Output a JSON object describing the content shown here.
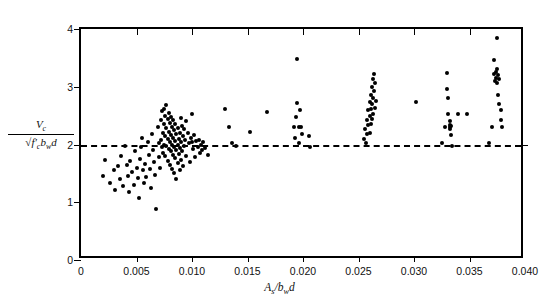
{
  "chart_data": {
    "type": "scatter",
    "title": "",
    "xlabel": "As/bwd",
    "ylabel": "Vc/sqrt(f'c)bwd",
    "xlim": [
      0,
      0.04
    ],
    "ylim": [
      0,
      4
    ],
    "xticks": [
      0,
      0.005,
      0.01,
      0.015,
      0.02,
      0.025,
      0.03,
      0.035,
      0.04
    ],
    "xticklabels": [
      "0",
      "0.005",
      "0.010",
      "0.015",
      "0.020",
      "0.025",
      "0.030",
      "0.035",
      "0.040"
    ],
    "yticks": [
      0,
      1,
      2,
      3,
      4
    ],
    "yticklabels": [
      "0",
      "1",
      "2",
      "3",
      "4"
    ],
    "grid": false,
    "legend": null,
    "marker": "filled-circle",
    "marker_color": "#000000",
    "reference_line": {
      "type": "horizontal-dashed",
      "y": 2.0,
      "label": "Vc = 2*sqrt(f'c)bwd",
      "style": "dashed",
      "color": "#000000"
    },
    "annotation": {
      "text": "Vc  = 2√f'cbwd",
      "points_to_x": 0.0195,
      "points_to_y": 2.0
    },
    "points": [
      [
        0.002,
        1.46
      ],
      [
        0.0022,
        1.73
      ],
      [
        0.0026,
        1.34
      ],
      [
        0.003,
        1.55
      ],
      [
        0.0031,
        1.21
      ],
      [
        0.0033,
        1.62
      ],
      [
        0.0035,
        1.4
      ],
      [
        0.0036,
        1.8
      ],
      [
        0.0038,
        1.28
      ],
      [
        0.004,
        1.98
      ],
      [
        0.0041,
        1.64
      ],
      [
        0.0042,
        1.45
      ],
      [
        0.0043,
        1.18
      ],
      [
        0.0044,
        1.71
      ],
      [
        0.0046,
        1.52
      ],
      [
        0.0048,
        1.3
      ],
      [
        0.0049,
        1.88
      ],
      [
        0.005,
        1.6
      ],
      [
        0.0051,
        1.42
      ],
      [
        0.0052,
        1.08
      ],
      [
        0.0053,
        1.75
      ],
      [
        0.0054,
        1.96
      ],
      [
        0.0055,
        2.12
      ],
      [
        0.0056,
        1.56
      ],
      [
        0.0057,
        1.33
      ],
      [
        0.0058,
        1.67
      ],
      [
        0.0059,
        1.44
      ],
      [
        0.006,
        2.05
      ],
      [
        0.0061,
        1.82
      ],
      [
        0.0062,
        1.58
      ],
      [
        0.0063,
        1.25
      ],
      [
        0.0064,
        2.18
      ],
      [
        0.0065,
        1.9
      ],
      [
        0.0066,
        1.7
      ],
      [
        0.0067,
        1.48
      ],
      [
        0.0068,
        0.88
      ],
      [
        0.0069,
        2.3
      ],
      [
        0.007,
        2.02
      ],
      [
        0.007,
        1.78
      ],
      [
        0.0071,
        1.6
      ],
      [
        0.0072,
        2.42
      ],
      [
        0.0072,
        2.08
      ],
      [
        0.0073,
        1.95
      ],
      [
        0.0073,
        2.58
      ],
      [
        0.0074,
        2.2
      ],
      [
        0.0074,
        1.86
      ],
      [
        0.0075,
        2.62
      ],
      [
        0.0075,
        2.35
      ],
      [
        0.0075,
        2.0
      ],
      [
        0.0076,
        2.5
      ],
      [
        0.0076,
        2.15
      ],
      [
        0.0076,
        1.8
      ],
      [
        0.0077,
        2.68
      ],
      [
        0.0077,
        2.28
      ],
      [
        0.0077,
        1.98
      ],
      [
        0.0078,
        2.45
      ],
      [
        0.0078,
        2.1
      ],
      [
        0.0078,
        1.72
      ],
      [
        0.0079,
        2.55
      ],
      [
        0.0079,
        2.22
      ],
      [
        0.0079,
        1.92
      ],
      [
        0.008,
        2.38
      ],
      [
        0.008,
        2.05
      ],
      [
        0.008,
        1.65
      ],
      [
        0.0081,
        2.48
      ],
      [
        0.0081,
        2.16
      ],
      [
        0.0081,
        1.88
      ],
      [
        0.0082,
        2.3
      ],
      [
        0.0082,
        2.0
      ],
      [
        0.0082,
        1.58
      ],
      [
        0.0083,
        2.42
      ],
      [
        0.0083,
        2.12
      ],
      [
        0.0083,
        1.82
      ],
      [
        0.0084,
        2.25
      ],
      [
        0.0084,
        1.96
      ],
      [
        0.0084,
        1.5
      ],
      [
        0.0085,
        2.35
      ],
      [
        0.0085,
        2.06
      ],
      [
        0.0085,
        1.76
      ],
      [
        0.0086,
        2.18
      ],
      [
        0.0086,
        1.9
      ],
      [
        0.0086,
        1.4
      ],
      [
        0.0087,
        2.28
      ],
      [
        0.0087,
        2.0
      ],
      [
        0.0087,
        1.68
      ],
      [
        0.0088,
        2.1
      ],
      [
        0.0088,
        1.84
      ],
      [
        0.0089,
        2.2
      ],
      [
        0.0089,
        1.94
      ],
      [
        0.0089,
        1.56
      ],
      [
        0.009,
        2.46
      ],
      [
        0.009,
        2.04
      ],
      [
        0.009,
        1.74
      ],
      [
        0.0091,
        2.32
      ],
      [
        0.0091,
        1.88
      ],
      [
        0.0092,
        2.14
      ],
      [
        0.0092,
        1.62
      ],
      [
        0.0093,
        2.26
      ],
      [
        0.0093,
        1.98
      ],
      [
        0.0094,
        2.08
      ],
      [
        0.0095,
        2.4
      ],
      [
        0.0095,
        1.8
      ],
      [
        0.0096,
        2.2
      ],
      [
        0.0097,
        2.02
      ],
      [
        0.0098,
        1.7
      ],
      [
        0.0099,
        2.12
      ],
      [
        0.01,
        2.52
      ],
      [
        0.01,
        2.04
      ],
      [
        0.0101,
        1.92
      ],
      [
        0.0102,
        2.16
      ],
      [
        0.0103,
        1.78
      ],
      [
        0.0104,
        2.06
      ],
      [
        0.0105,
        1.96
      ],
      [
        0.0106,
        2.08
      ],
      [
        0.0107,
        1.86
      ],
      [
        0.0108,
        2.0
      ],
      [
        0.0109,
        1.9
      ],
      [
        0.011,
        2.04
      ],
      [
        0.0112,
        1.94
      ],
      [
        0.0114,
        1.82
      ],
      [
        0.013,
        2.62
      ],
      [
        0.0133,
        2.3
      ],
      [
        0.0136,
        2.02
      ],
      [
        0.014,
        1.98
      ],
      [
        0.0152,
        2.22
      ],
      [
        0.0168,
        2.56
      ],
      [
        0.0192,
        2.3
      ],
      [
        0.0193,
        2.12
      ],
      [
        0.0194,
        2.48
      ],
      [
        0.0195,
        3.48
      ],
      [
        0.0195,
        2.72
      ],
      [
        0.0196,
        2.3
      ],
      [
        0.0196,
        2.02
      ],
      [
        0.0197,
        2.6
      ],
      [
        0.0198,
        2.3
      ],
      [
        0.0199,
        2.18
      ],
      [
        0.0205,
        2.14
      ],
      [
        0.0206,
        1.96
      ],
      [
        0.0255,
        2.1
      ],
      [
        0.0256,
        2.26
      ],
      [
        0.0257,
        2.02
      ],
      [
        0.0258,
        2.42
      ],
      [
        0.0258,
        2.18
      ],
      [
        0.0259,
        2.6
      ],
      [
        0.0259,
        2.34
      ],
      [
        0.026,
        2.74
      ],
      [
        0.026,
        2.5
      ],
      [
        0.026,
        2.2
      ],
      [
        0.0261,
        2.86
      ],
      [
        0.0261,
        2.62
      ],
      [
        0.0261,
        2.36
      ],
      [
        0.0262,
        3.0
      ],
      [
        0.0262,
        2.7
      ],
      [
        0.0262,
        2.44
      ],
      [
        0.0263,
        3.14
      ],
      [
        0.0263,
        2.8
      ],
      [
        0.0263,
        2.52
      ],
      [
        0.0264,
        3.22
      ],
      [
        0.0264,
        2.92
      ],
      [
        0.0265,
        3.06
      ],
      [
        0.0265,
        2.64
      ],
      [
        0.0266,
        2.76
      ],
      [
        0.0302,
        2.74
      ],
      [
        0.0325,
        2.02
      ],
      [
        0.0328,
        2.3
      ],
      [
        0.033,
        3.24
      ],
      [
        0.033,
        2.96
      ],
      [
        0.0331,
        2.8
      ],
      [
        0.0331,
        2.52
      ],
      [
        0.0332,
        2.4
      ],
      [
        0.0332,
        2.34
      ],
      [
        0.0332,
        2.3
      ],
      [
        0.0332,
        2.26
      ],
      [
        0.0333,
        2.32
      ],
      [
        0.0333,
        2.16
      ],
      [
        0.0334,
        1.98
      ],
      [
        0.034,
        2.52
      ],
      [
        0.0348,
        2.52
      ],
      [
        0.0368,
        2.02
      ],
      [
        0.037,
        2.3
      ],
      [
        0.0372,
        3.46
      ],
      [
        0.0372,
        3.22
      ],
      [
        0.0373,
        3.1
      ],
      [
        0.0374,
        3.26
      ],
      [
        0.0374,
        3.16
      ],
      [
        0.0375,
        3.85
      ],
      [
        0.0375,
        3.3
      ],
      [
        0.0375,
        3.06
      ],
      [
        0.0376,
        3.2
      ],
      [
        0.0376,
        2.86
      ],
      [
        0.0377,
        3.14
      ],
      [
        0.0377,
        2.7
      ],
      [
        0.0378,
        2.6
      ],
      [
        0.0378,
        2.42
      ],
      [
        0.0379,
        2.3
      ]
    ]
  },
  "axes": {
    "y_label_numerator": "V",
    "y_label_numerator_sub": "c",
    "y_label_denominator_pre": "f",
    "y_label_denominator_prime": "′",
    "y_label_denominator_sub": "c",
    "y_label_denominator_post": "b",
    "y_label_denominator_sub2": "w",
    "y_label_denominator_post2": "d",
    "x_label_pre": "A",
    "x_label_sub": "s",
    "x_label_mid": "/b",
    "x_label_sub2": "w",
    "x_label_post": "d"
  },
  "annotation_text": {
    "v": "V",
    "v_sub": "c",
    "eq": "=  2",
    "radicand_f": "f",
    "radicand_prime": "′",
    "radicand_sub": "c",
    "radicand_b": "b",
    "radicand_sub2": "w",
    "radicand_d": "d"
  }
}
